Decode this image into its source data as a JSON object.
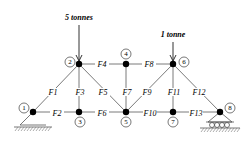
{
  "diagram": {
    "type": "plane truss",
    "nodes": [
      {
        "id": "1",
        "label": "1",
        "x": 33,
        "y": 112,
        "lx": 24,
        "ly": 108
      },
      {
        "id": "2",
        "label": "2",
        "x": 79,
        "y": 64,
        "lx": 70,
        "ly": 62
      },
      {
        "id": "3",
        "label": "3",
        "x": 79,
        "y": 112,
        "lx": 80,
        "ly": 122
      },
      {
        "id": "4",
        "label": "4",
        "x": 126,
        "y": 64,
        "lx": 126,
        "ly": 54
      },
      {
        "id": "5",
        "label": "5",
        "x": 126,
        "y": 112,
        "lx": 126,
        "ly": 122
      },
      {
        "id": "6",
        "label": "6",
        "x": 173,
        "y": 64,
        "lx": 184,
        "ly": 62
      },
      {
        "id": "7",
        "label": "7",
        "x": 173,
        "y": 112,
        "lx": 173,
        "ly": 122
      },
      {
        "id": "8",
        "label": "8",
        "x": 220,
        "y": 112,
        "lx": 230,
        "ly": 108
      }
    ],
    "members": [
      {
        "label": "F1",
        "from": "1",
        "to": "2",
        "lx": 53,
        "ly": 92
      },
      {
        "label": "F2",
        "from": "1",
        "to": "3",
        "lx": 57,
        "ly": 113
      },
      {
        "label": "F3",
        "from": "2",
        "to": "3",
        "lx": 80,
        "ly": 92
      },
      {
        "label": "F4",
        "from": "2",
        "to": "4",
        "lx": 102,
        "ly": 64
      },
      {
        "label": "F5",
        "from": "2",
        "to": "5",
        "lx": 103,
        "ly": 92
      },
      {
        "label": "F6",
        "from": "3",
        "to": "5",
        "lx": 102,
        "ly": 113
      },
      {
        "label": "F7",
        "from": "4",
        "to": "5",
        "lx": 127,
        "ly": 92
      },
      {
        "label": "F8",
        "from": "4",
        "to": "6",
        "lx": 149,
        "ly": 64
      },
      {
        "label": "F9",
        "from": "5",
        "to": "6",
        "lx": 147,
        "ly": 92
      },
      {
        "label": "F10",
        "from": "5",
        "to": "7",
        "lx": 150,
        "ly": 113
      },
      {
        "label": "F11",
        "from": "6",
        "to": "7",
        "lx": 174,
        "ly": 92
      },
      {
        "label": "F12",
        "from": "6",
        "to": "8",
        "lx": 199,
        "ly": 92
      },
      {
        "label": "F13",
        "from": "7",
        "to": "8",
        "lx": 196,
        "ly": 113
      }
    ],
    "loads": [
      {
        "label": "5 tonnes",
        "node": "2",
        "lx": 79,
        "ly": 20,
        "arrow_top": 25
      },
      {
        "label": "1 tonne",
        "node": "6",
        "lx": 173,
        "ly": 37,
        "arrow_top": 42
      }
    ],
    "supports": [
      {
        "type": "pinned",
        "node": "1"
      },
      {
        "type": "roller",
        "node": "8"
      }
    ]
  }
}
